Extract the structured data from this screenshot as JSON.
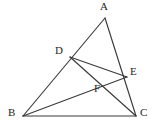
{
  "figure": {
    "type": "geometry-diagram",
    "background_color": "#ffffff",
    "stroke_color": "#3a3a3a",
    "label_color": "#262626",
    "width": 159,
    "height": 129,
    "points": [
      {
        "id": "A",
        "label": "A",
        "x": 105,
        "y": 18,
        "label_x": 100,
        "label_y": 1,
        "on": "apex"
      },
      {
        "id": "B",
        "label": "B",
        "x": 23,
        "y": 116,
        "label_x": 8,
        "label_y": 108,
        "on": "base-left"
      },
      {
        "id": "C",
        "label": "C",
        "x": 136,
        "y": 116,
        "label_x": 140,
        "label_y": 108,
        "on": "base-right"
      },
      {
        "id": "D",
        "label": "D",
        "x": 70,
        "y": 57,
        "label_x": 55,
        "label_y": 45,
        "on": "segment-AB"
      },
      {
        "id": "E",
        "label": "E",
        "x": 127,
        "y": 77,
        "label_x": 130,
        "label_y": 67,
        "on": "segment-AC"
      },
      {
        "id": "F",
        "label": "F",
        "x": 100,
        "y": 88,
        "label_x": 94,
        "label_y": 84,
        "on": "intersection-DC-BE"
      }
    ],
    "segments": [
      {
        "id": "AB",
        "from": "A",
        "to": "B",
        "name": "side-ab"
      },
      {
        "id": "AC",
        "from": "A",
        "to": "C",
        "name": "side-ac"
      },
      {
        "id": "BC",
        "from": "B",
        "to": "C",
        "name": "side-bc"
      },
      {
        "id": "DE",
        "from": "D",
        "to": "E",
        "name": "cevian-de"
      },
      {
        "id": "DC",
        "from": "D",
        "to": "C",
        "name": "cevian-dc"
      },
      {
        "id": "BE",
        "from": "B",
        "to": "E",
        "name": "cevian-be"
      }
    ]
  }
}
